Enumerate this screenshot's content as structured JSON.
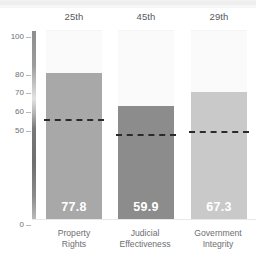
{
  "chart_data": {
    "type": "bar",
    "title": "",
    "xlabel": "",
    "ylabel": "",
    "ylim": [
      0,
      100
    ],
    "grid": false,
    "legend": "none",
    "categories": [
      "Property Rights",
      "Judicial Effectiveness",
      "Government Integrity"
    ],
    "values": [
      77.8,
      59.9,
      67.3
    ],
    "value_labels": [
      "77.8",
      "59.9",
      "67.3"
    ],
    "rank_labels": [
      "25th",
      "45th",
      "29th"
    ],
    "reference_lines": [
      52.0,
      44.0,
      46.0
    ],
    "reference_line_style": "dashed",
    "ytick_labels": [
      "100",
      "80",
      "70",
      "60",
      "50",
      "0"
    ],
    "ytick_values": [
      100,
      80,
      70,
      60,
      50,
      0
    ],
    "bar_colors": [
      "#a8a8a8",
      "#8c8c8c",
      "#c9c9c9"
    ],
    "track_color": "#fafafa",
    "axis_label_color": "#6d6e71",
    "value_label_color": "#ffffff",
    "reference_line_color": "#2a2a2a"
  },
  "axis": {
    "ticks": [
      {
        "label": "100",
        "value": 100
      },
      {
        "label": "80",
        "value": 80
      },
      {
        "label": "70",
        "value": 70
      },
      {
        "label": "60",
        "value": 60
      },
      {
        "label": "50",
        "value": 50
      },
      {
        "label": "0",
        "value": 0
      }
    ]
  },
  "columns": [
    {
      "rank": "25th",
      "category_line1": "Property",
      "category_line2": "Rights",
      "value_label": "77.8"
    },
    {
      "rank": "45th",
      "category_line1": "Judicial",
      "category_line2": "Effectiveness",
      "value_label": "59.9"
    },
    {
      "rank": "29th",
      "category_line1": "Government",
      "category_line2": "Integrity",
      "value_label": "67.3"
    }
  ]
}
